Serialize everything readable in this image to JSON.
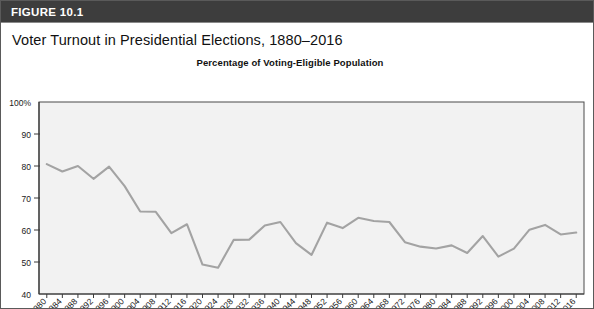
{
  "figure": {
    "label": "FIGURE 10.1",
    "title": "Voter Turnout in Presidential Elections, 1880–2016"
  },
  "colors": {
    "header_bg": "#3d3d3d",
    "header_text": "#ffffff",
    "plot_bg": "#f2f2f2",
    "plot_border": "#4a4a4a",
    "line": "#a3a3a3",
    "axis_text": "#1a1a1a"
  },
  "chart_data": {
    "type": "line",
    "title": "Percentage of Voting-Eligible Population",
    "xlabel": "",
    "ylabel": "",
    "ylim": [
      40,
      100
    ],
    "ytick_values": [
      40,
      50,
      60,
      70,
      80,
      90,
      100
    ],
    "ytick_labels": [
      "40",
      "50",
      "60",
      "70",
      "80",
      "90",
      "100%"
    ],
    "grid": false,
    "legend": "none",
    "categories": [
      "1880",
      "1884",
      "1888",
      "1892",
      "1896",
      "1900",
      "1904",
      "1908",
      "1912",
      "1916",
      "1920",
      "1924",
      "1928",
      "1932",
      "1936",
      "1940",
      "1944",
      "1948",
      "1952",
      "1956",
      "1960",
      "1964",
      "1968",
      "1972",
      "1976",
      "1980",
      "1984",
      "1988",
      "1992",
      "1996",
      "2000",
      "2004",
      "2008",
      "2012",
      "2016"
    ],
    "series": [
      {
        "name": "Voter turnout",
        "values": [
          80.6,
          78.3,
          80.0,
          76.0,
          79.8,
          73.7,
          65.8,
          65.7,
          59.0,
          61.8,
          49.2,
          48.2,
          56.9,
          57.0,
          61.4,
          62.5,
          55.9,
          52.2,
          62.3,
          60.6,
          63.8,
          62.8,
          62.5,
          56.2,
          54.8,
          54.2,
          55.2,
          52.8,
          58.1,
          51.7,
          54.2,
          60.1,
          61.6,
          58.6,
          59.2
        ]
      }
    ]
  }
}
